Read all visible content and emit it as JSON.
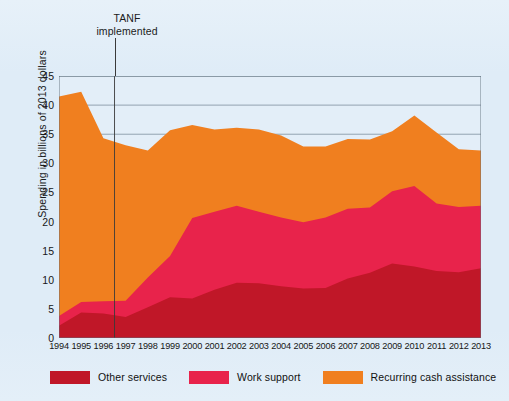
{
  "figure": {
    "background_color": "#dfecf7",
    "plot_background_color": "#e3eef8",
    "border_color": "#7e8f9e"
  },
  "annotation": {
    "line1": "TANF",
    "line2": "implemented",
    "marker_year": 1996.5,
    "marker_color": "#3a3a3a"
  },
  "legend": {
    "position": "bottom",
    "items": [
      {
        "label": "Other services",
        "color": "#c01728"
      },
      {
        "label": "Work support",
        "color": "#e8234b"
      },
      {
        "label": "Recurring cash assistance",
        "color": "#f07f1f"
      }
    ]
  },
  "chart_data": {
    "type": "area",
    "stacked": true,
    "title": "",
    "subtitle": "",
    "xlabel": "",
    "ylabel": "Spending in billions of 2013 dollars",
    "xlim": [
      1994,
      2013
    ],
    "ylim": [
      0,
      45
    ],
    "ytick_step": 5,
    "yticks": [
      0,
      5,
      10,
      15,
      20,
      25,
      30,
      35,
      40,
      45
    ],
    "grid": "horizontal",
    "annotations": [
      {
        "text": "TANF implemented",
        "x": 1996.5,
        "type": "vertical-line"
      }
    ],
    "x": [
      1994,
      1995,
      1996,
      1997,
      1998,
      1999,
      2000,
      2001,
      2002,
      2003,
      2004,
      2005,
      2006,
      2007,
      2008,
      2009,
      2010,
      2011,
      2012,
      2013
    ],
    "categories": [
      "1994",
      "1995",
      "1996",
      "1997",
      "1998",
      "1999",
      "2000",
      "2001",
      "2002",
      "2003",
      "2004",
      "2005",
      "2006",
      "2007",
      "2008",
      "2009",
      "2010",
      "2011",
      "2012",
      "2013"
    ],
    "series": [
      {
        "name": "Other services",
        "color": "#c01728",
        "values": [
          2.1,
          4.4,
          4.2,
          3.6,
          5.3,
          7.0,
          6.8,
          8.3,
          9.5,
          9.4,
          8.9,
          8.5,
          8.6,
          10.2,
          11.2,
          12.8,
          12.3,
          11.5,
          11.3,
          12.0
        ]
      },
      {
        "name": "Work support",
        "color": "#e8234b",
        "values": [
          1.7,
          1.8,
          2.1,
          2.8,
          5.1,
          7.1,
          13.8,
          13.4,
          13.2,
          12.3,
          11.8,
          11.4,
          12.1,
          12.0,
          11.2,
          12.4,
          13.8,
          11.6,
          11.2,
          10.7
        ]
      },
      {
        "name": "Recurring cash assistance",
        "color": "#f07f1f",
        "values": [
          37.7,
          36.1,
          28.0,
          26.7,
          21.8,
          21.6,
          16.0,
          14.1,
          13.4,
          14.1,
          14.1,
          13.0,
          12.2,
          12.0,
          11.7,
          10.3,
          12.1,
          12.2,
          9.9,
          9.5
        ]
      }
    ],
    "series_totals": [
      41.5,
      42.3,
      34.3,
      33.1,
      32.2,
      35.7,
      36.6,
      35.8,
      36.1,
      35.8,
      34.8,
      32.9,
      32.9,
      34.2,
      34.1,
      35.5,
      38.2,
      35.3,
      32.4,
      32.2
    ]
  }
}
